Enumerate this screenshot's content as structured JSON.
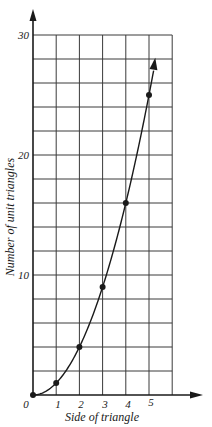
{
  "chart_data": {
    "type": "line",
    "title": "",
    "xlabel": "Side of triangle",
    "ylabel": "Number of unit triangles",
    "x": [
      0,
      1,
      2,
      3,
      4,
      5
    ],
    "series": [
      {
        "name": "Number of unit triangles",
        "values": [
          0,
          1,
          4,
          9,
          16,
          25
        ],
        "markers": true,
        "curve": "smooth",
        "arrow_at_end": true
      }
    ],
    "xlim": [
      0,
      6
    ],
    "ylim": [
      0,
      30
    ],
    "x_ticks": [
      "0",
      "1",
      "2",
      "3",
      "4",
      "5"
    ],
    "y_ticks": [
      "0",
      "10",
      "20",
      "30"
    ],
    "grid": true,
    "grid_x_step": 1,
    "grid_y_step": 2,
    "legend": "none"
  },
  "labels": {
    "xlabel": "Side of triangle",
    "ylabel": "Number of unit triangles",
    "x_ticks": [
      "0",
      "1",
      "2",
      "3",
      "4",
      "5"
    ],
    "y_ticks": {
      "y10": "10",
      "y20": "20",
      "y30": "30"
    }
  },
  "colors": {
    "ink": "#1a1a1a",
    "grid": "#3a3a3a",
    "background": "#ffffff"
  }
}
